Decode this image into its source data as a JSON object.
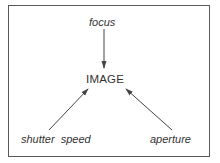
{
  "diagram": {
    "center_node": "IMAGE",
    "inputs": [
      {
        "label": "focus",
        "position": "top"
      },
      {
        "label": "shutter speed",
        "position": "bottom-left"
      },
      {
        "label": "aperture",
        "position": "bottom-right"
      }
    ],
    "colors": {
      "line": "#444444",
      "text": "#333333",
      "border": "#5a5a5a"
    }
  }
}
